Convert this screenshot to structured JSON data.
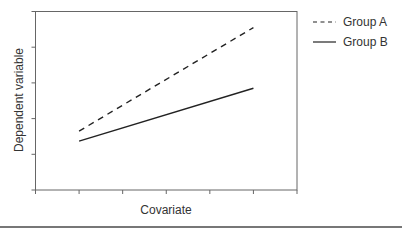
{
  "chart_data": {
    "type": "line",
    "title": "",
    "xlabel": "Covariate",
    "ylabel": "Dependent variable",
    "x_ticks": 7,
    "y_ticks": 6,
    "tick_labels_shown": false,
    "grid": false,
    "legend_position": "right-top",
    "x": [
      1,
      5
    ],
    "xlim": [
      0,
      6
    ],
    "ylim": [
      0,
      5
    ],
    "series": [
      {
        "name": "Group A",
        "style": "dashed",
        "values": [
          1.65,
          4.55
        ]
      },
      {
        "name": "Group B",
        "style": "solid",
        "values": [
          1.37,
          2.85
        ]
      }
    ]
  },
  "legend": {
    "items": [
      {
        "label": "Group A"
      },
      {
        "label": "Group B"
      }
    ]
  },
  "colors": {
    "line": "#222222",
    "axis": "#555555",
    "rule": "#777777"
  }
}
